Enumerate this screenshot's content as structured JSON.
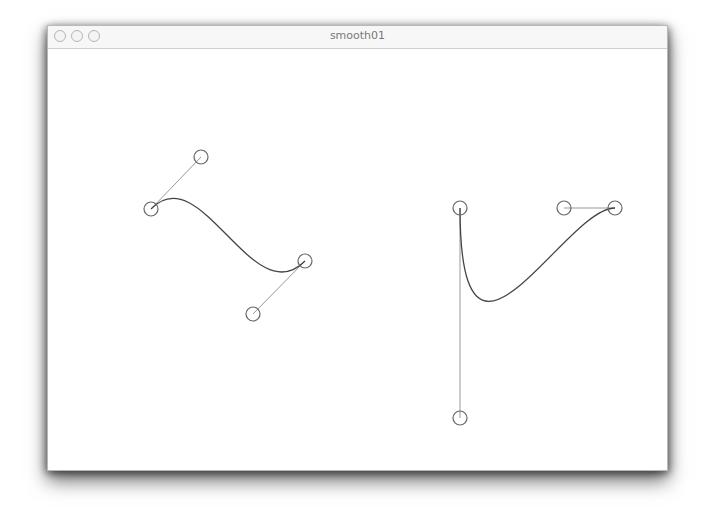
{
  "window": {
    "title": "smooth01",
    "buttons": [
      "close",
      "minimize",
      "zoom"
    ]
  },
  "canvas": {
    "background": "#ffffff",
    "curve_color": "#444444",
    "handle_color": "#999999",
    "point_color": "#666666",
    "curves": [
      {
        "anchor1": [
          150,
          208
        ],
        "control1": [
          200,
          156
        ],
        "control2": [
          252,
          313
        ],
        "anchor2": [
          304,
          260
        ]
      },
      {
        "anchor1": [
          459,
          207
        ],
        "control1": [
          459,
          417
        ],
        "control2": [
          563,
          207
        ],
        "anchor2": [
          614,
          207
        ]
      }
    ],
    "point_radius": 7
  }
}
